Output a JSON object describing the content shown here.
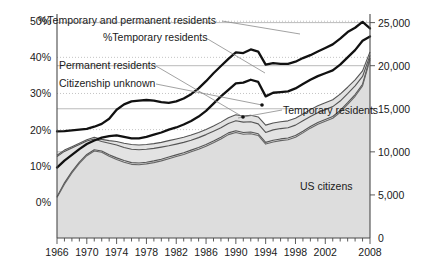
{
  "chart_data": {
    "type": "line",
    "title": "",
    "subtitle": "",
    "xlabel": "",
    "ylabel": "",
    "y2label": "",
    "grid": true,
    "legend_position": "inline-annotations",
    "x": [
      1966,
      1967,
      1968,
      1969,
      1970,
      1971,
      1972,
      1973,
      1974,
      1975,
      1976,
      1977,
      1978,
      1979,
      1980,
      1981,
      1982,
      1983,
      1984,
      1985,
      1986,
      1987,
      1988,
      1989,
      1990,
      1991,
      1992,
      1993,
      1994,
      1995,
      1996,
      1997,
      1998,
      1999,
      2000,
      2001,
      2002,
      2003,
      2004,
      2005,
      2006,
      2007,
      2008
    ],
    "x_tick_labels": [
      "1966",
      "1970",
      "1974",
      "1978",
      "1982",
      "1986",
      "1990",
      "1994",
      "1998",
      "2002",
      "2008"
    ],
    "x_tick_values": [
      1966,
      1970,
      1974,
      1978,
      1982,
      1986,
      1990,
      1994,
      1998,
      2002,
      2008
    ],
    "xlim": [
      1966,
      2008
    ],
    "left_axis": {
      "label": "",
      "tick_labels": [
        "0%",
        "10%",
        "20%",
        "30%",
        "40%",
        "50%"
      ],
      "tick_values": [
        0,
        10,
        20,
        30,
        40,
        50
      ],
      "ylim": [
        -10,
        52
      ],
      "unit": "%"
    },
    "right_axis": {
      "label": "",
      "tick_labels": [
        "0",
        "5,000",
        "10,000",
        "15,000",
        "20,000",
        "25,000"
      ],
      "tick_values": [
        0,
        5000,
        10000,
        15000,
        20000,
        25000
      ],
      "ylim": [
        0,
        26000
      ],
      "unit": "count"
    },
    "series": [
      {
        "name": "%Temporary and permanent residents",
        "axis": "left",
        "style": "thick-black-line",
        "color": "#111111",
        "values": [
          19.5,
          19.6,
          19.8,
          20.0,
          20.2,
          20.8,
          21.6,
          23.0,
          25.5,
          27.0,
          27.8,
          28.0,
          28.2,
          28.0,
          27.6,
          27.4,
          27.8,
          28.6,
          29.8,
          31.4,
          33.4,
          35.6,
          37.6,
          39.6,
          41.4,
          41.2,
          42.2,
          41.6,
          38.0,
          38.4,
          38.2,
          38.2,
          38.8,
          39.8,
          40.6,
          41.6,
          42.6,
          43.6,
          45.2,
          47.0,
          48.2,
          49.8,
          48.0
        ]
      },
      {
        "name": "%Temporary residents",
        "axis": "left",
        "style": "thick-black-line",
        "color": "#111111",
        "values": [
          9.5,
          11.4,
          13.0,
          14.6,
          16.0,
          17.0,
          17.8,
          18.2,
          18.4,
          18.0,
          17.6,
          17.6,
          18.0,
          18.6,
          19.2,
          20.0,
          20.6,
          21.4,
          22.4,
          23.6,
          25.2,
          27.2,
          29.2,
          31.0,
          32.8,
          33.0,
          33.8,
          33.2,
          29.2,
          30.2,
          30.4,
          30.6,
          31.4,
          32.6,
          33.8,
          34.8,
          35.6,
          36.4,
          38.0,
          40.0,
          42.0,
          44.6,
          45.8
        ]
      },
      {
        "name": "Permanent residents",
        "axis": "right",
        "style": "thin-gray-band",
        "color": "#555555",
        "values": [
          9600,
          10200,
          10600,
          11000,
          11400,
          11700,
          11450,
          11300,
          11200,
          11000,
          10850,
          10800,
          10850,
          10950,
          11100,
          11300,
          11500,
          11700,
          11950,
          12250,
          12600,
          13000,
          13450,
          13950,
          14300,
          14150,
          14250,
          14050,
          13100,
          13350,
          13500,
          13600,
          13900,
          14400,
          14900,
          15350,
          15700,
          16050,
          16700,
          17500,
          18350,
          19400,
          21600
        ]
      },
      {
        "name": "Citizenship unknown",
        "axis": "right",
        "style": "thin-gray-band",
        "color": "#555555",
        "values": [
          9450,
          10050,
          10450,
          10850,
          11250,
          11500,
          11200,
          11000,
          10800,
          10500,
          10300,
          10250,
          10300,
          10400,
          10550,
          10700,
          10900,
          11100,
          11350,
          11650,
          12000,
          12400,
          12800,
          13300,
          13600,
          13450,
          13500,
          13250,
          12250,
          12550,
          12700,
          12800,
          13100,
          13600,
          14100,
          14550,
          14900,
          15250,
          15900,
          16750,
          17650,
          18750,
          21200
        ]
      },
      {
        "name": "Temporary residents",
        "axis": "right",
        "style": "thin-gray-band",
        "color": "#555555",
        "values": [
          4800,
          6400,
          7700,
          8800,
          9700,
          10250,
          10100,
          9650,
          9300,
          9000,
          8750,
          8700,
          8800,
          8950,
          9150,
          9400,
          9650,
          9900,
          10200,
          10500,
          10850,
          11250,
          11700,
          12200,
          12450,
          12250,
          12300,
          12100,
          11100,
          11350,
          11500,
          11600,
          11900,
          12400,
          12950,
          13400,
          13750,
          14100,
          14800,
          15700,
          16650,
          17850,
          20900
        ]
      },
      {
        "name": "US citizens",
        "axis": "right",
        "style": "thin-gray-band-fill",
        "color": "#666666",
        "values": [
          4700,
          6250,
          7550,
          8650,
          9550,
          10100,
          9950,
          9500,
          9100,
          8800,
          8550,
          8500,
          8600,
          8750,
          8950,
          9200,
          9450,
          9700,
          10000,
          10300,
          10650,
          11050,
          11500,
          12000,
          12250,
          12050,
          12100,
          11900,
          10900,
          11150,
          11300,
          11400,
          11700,
          12200,
          12750,
          13200,
          13550,
          13900,
          14600,
          15500,
          16450,
          17650,
          20700
        ]
      }
    ],
    "annotations": [
      {
        "name": "pct-temp-and-perm-label",
        "text": "%Temporary and permanent residents",
        "x_px": 38,
        "y_px": 24,
        "anchor": "start"
      },
      {
        "name": "pct-temp-label",
        "text": "%Temporary residents",
        "x_px": 103,
        "y_px": 41,
        "anchor": "start"
      },
      {
        "name": "permanent-residents-label",
        "text": "Permanent residents",
        "x_px": 59,
        "y_px": 69,
        "anchor": "start"
      },
      {
        "name": "citizenship-unknown-label",
        "text": "Citizenship unknown",
        "x_px": 59,
        "y_px": 87,
        "anchor": "start"
      },
      {
        "name": "temporary-residents-label",
        "text": "Temporary residents",
        "x_px": 283,
        "y_px": 114,
        "anchor": "start"
      },
      {
        "name": "us-citizens-label",
        "text": "US citizens",
        "x_px": 300,
        "y_px": 190,
        "anchor": "start"
      }
    ],
    "colors": {
      "thick_line": "#111111",
      "thin_line": "#555555",
      "fill_band": "#e3e3e3",
      "gridline_solid": "#a8a8a8",
      "gridline_dotted": "#bdbdbd",
      "axis": "#4a4a4a",
      "text": "#1a1a1a"
    }
  }
}
